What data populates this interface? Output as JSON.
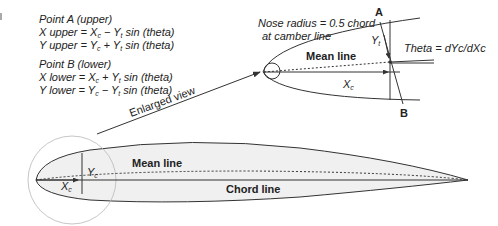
{
  "formulas": {
    "point_a": {
      "title": "Point A (upper)",
      "x_eq": "X upper = Xc − Yt sin (theta)",
      "y_eq": "Y upper = Yc + Yt sin (theta)"
    },
    "point_b": {
      "title": "Point B (lower)",
      "x_eq": "X lower = Xc + Yt sin (theta)",
      "y_eq": "Y lower = Yc − Yt sin (theta)"
    }
  },
  "enlarged": {
    "nose_note_line1": "Nose radius = 0.5 chord",
    "nose_note_line2": "at camber line",
    "mean_line": "Mean line",
    "xc": "X",
    "xc_sub": "c",
    "yt": "Y",
    "yt_sub": "t",
    "point_a": "A",
    "point_b": "B",
    "theta": "Theta = dYc/dXc"
  },
  "arrow_label": "Enlarged view",
  "airfoil": {
    "mean_line": "Mean line",
    "chord_line": "Chord line",
    "xc": "X",
    "xc_sub": "c",
    "yc": "Y",
    "yc_sub": "c"
  },
  "colors": {
    "stroke": "#333333",
    "fill": "#f0f0f0",
    "circle": "#b8b8b8"
  }
}
